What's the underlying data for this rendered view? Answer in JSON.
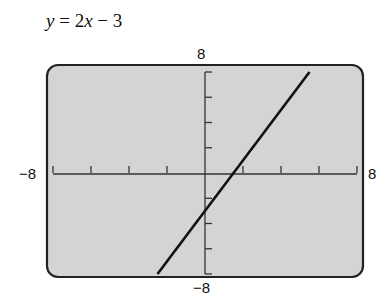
{
  "chart_data": {
    "type": "line",
    "title": "y = 2x − 3",
    "equation": "y = 2x − 3",
    "xlabel": "",
    "ylabel": "",
    "xlim": [
      -8,
      8
    ],
    "ylim": [
      -8,
      8
    ],
    "x_tick_step": 2,
    "y_tick_step": 2,
    "axis_labels": {
      "xmin": "−8",
      "xmax": "8",
      "ymin": "−8",
      "ymax": "8"
    },
    "grid": false,
    "series": [
      {
        "name": "y = 2x − 3",
        "x": [
          -2.5,
          5.5
        ],
        "y": [
          -8,
          8
        ]
      }
    ],
    "colors": {
      "screen_bg": "#d4d4d4",
      "line": "#111111",
      "frame": "#222222"
    }
  },
  "equation": {
    "lhs": "y",
    "rhs_coef": "2x",
    "rhs_const": "3"
  },
  "labels": {
    "xmin": "−8",
    "xmax": "8",
    "ymin": "−8",
    "ymax": "8"
  }
}
